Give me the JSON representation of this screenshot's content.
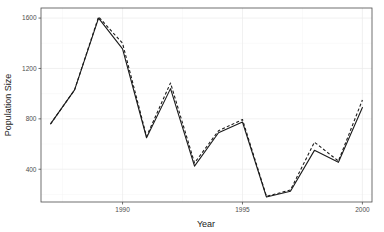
{
  "chart_data": {
    "type": "line",
    "title": "",
    "subtitle": "",
    "xlabel": "Year",
    "ylabel": "Population Size",
    "x": [
      1987,
      1988,
      1989,
      1990,
      1991,
      1992,
      1993,
      1994,
      1995,
      1996,
      1997,
      1998,
      1999,
      2000
    ],
    "xlim": [
      1986.6,
      2000.4
    ],
    "ylim": [
      140,
      1680
    ],
    "xticks": [
      1990,
      1995,
      2000
    ],
    "xticklabels": [
      "1990",
      "1995",
      "2000"
    ],
    "yticks": [
      400,
      800,
      1200,
      1600
    ],
    "yticklabels": [
      "400",
      "800",
      "1200",
      "1600"
    ],
    "grid": "major-and-minor",
    "legend": "none",
    "series": [
      {
        "name": "observed",
        "style": "solid",
        "color": "#1a1a1a",
        "values": [
          760,
          1030,
          1600,
          1355,
          650,
          1040,
          425,
          690,
          775,
          180,
          225,
          550,
          455,
          890
        ]
      },
      {
        "name": "fitted",
        "style": "dashed",
        "color": "#1a1a1a",
        "values": [
          760,
          1030,
          1610,
          1400,
          660,
          1085,
          450,
          705,
          795,
          185,
          235,
          615,
          465,
          950
        ]
      }
    ]
  },
  "axes": {
    "x_title": "Year",
    "y_title": "Population Size"
  }
}
